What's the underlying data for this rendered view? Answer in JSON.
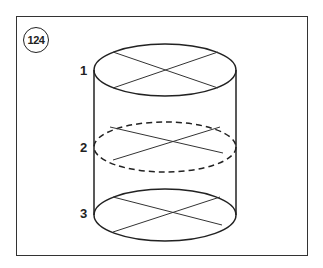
{
  "figure": {
    "number": "124",
    "labels": [
      {
        "id": "1",
        "text": "1"
      },
      {
        "id": "2",
        "text": "2"
      },
      {
        "id": "3",
        "text": "3"
      }
    ]
  }
}
